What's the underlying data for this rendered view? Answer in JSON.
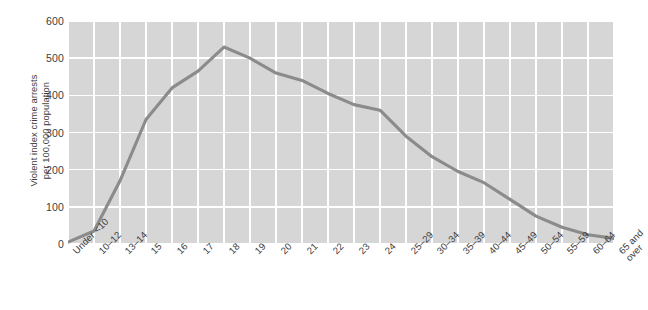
{
  "figure": {
    "background": "#ffffff",
    "plot_background": "#d6d6d6",
    "gridline_color": "#ffffff",
    "line_color": "#8b8b8b"
  },
  "axis": {
    "y_title_line1": "Violent index crime arrests",
    "y_title_line2": "per 100,000 population",
    "y_ticks": [
      "600",
      "500",
      "400",
      "300",
      "200",
      "100",
      "0"
    ]
  },
  "chart_data": {
    "type": "line",
    "title": "",
    "xlabel": "",
    "ylabel": "Violent index crime arrests per 100,000 population",
    "ylim": [
      0,
      600
    ],
    "yticks": [
      0,
      100,
      200,
      300,
      400,
      500,
      600
    ],
    "grid": true,
    "legend": "none",
    "categories": [
      "Under <10",
      "10–12",
      "13–14",
      "15",
      "16",
      "17",
      "18",
      "19",
      "20",
      "21",
      "22",
      "23",
      "24",
      "25–29",
      "30–34",
      "35–39",
      "40–44",
      "45–49",
      "50–54",
      "55–59",
      "60–64",
      "65 and over"
    ],
    "values": [
      5,
      35,
      170,
      335,
      420,
      465,
      530,
      500,
      460,
      440,
      405,
      375,
      360,
      290,
      235,
      195,
      165,
      120,
      75,
      45,
      25,
      15
    ],
    "series": [
      {
        "name": "Violent index crime arrests per 100,000 population",
        "values": [
          5,
          35,
          170,
          335,
          420,
          465,
          530,
          500,
          460,
          440,
          405,
          375,
          360,
          290,
          235,
          195,
          165,
          120,
          75,
          45,
          25,
          15
        ]
      }
    ]
  }
}
